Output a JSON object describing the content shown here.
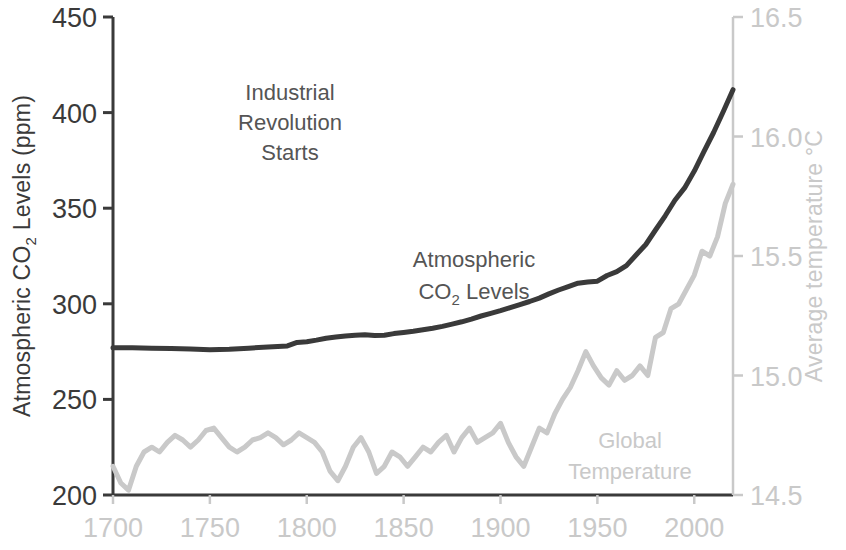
{
  "chart_data": {
    "type": "line",
    "title": "",
    "xlabel": "",
    "xlim": [
      1700,
      2020
    ],
    "x_ticks": [
      1700,
      1750,
      1800,
      1850,
      1900,
      1950,
      2000
    ],
    "x_tick_labels": [
      "1700",
      "1750",
      "1800",
      "1850",
      "1900",
      "1950",
      "2000"
    ],
    "grid": false,
    "legend_position": "inline-annotations",
    "axes": {
      "left": {
        "label": "Atmospheric CO₂ Levels (ppm)",
        "label_parts": [
          "Atmospheric CO",
          "2",
          " Levels (ppm)"
        ],
        "ylim": [
          200,
          450
        ],
        "ticks": [
          200,
          250,
          300,
          350,
          400,
          450
        ],
        "tick_labels": [
          "200",
          "250",
          "300",
          "350",
          "400",
          "450"
        ],
        "color": "#3a3a3a"
      },
      "right": {
        "label": "Average temperature °C",
        "ylim": [
          14.5,
          16.5
        ],
        "ticks": [
          14.5,
          15.0,
          15.5,
          16.0,
          16.5
        ],
        "tick_labels": [
          "14.5",
          "15.0",
          "15.5",
          "16.0",
          "16.5"
        ],
        "color": "#c9c9c9"
      }
    },
    "annotations": [
      {
        "name": "industrial-revolution",
        "text_lines": [
          "Industrial",
          "Revolution",
          "Starts"
        ],
        "x": 1760,
        "color": "#555555"
      },
      {
        "name": "co2-series-label",
        "text_lines": [
          "Atmospheric",
          "CO₂ Levels"
        ],
        "text_parts": [
          "Atmospheric",
          "CO",
          "2",
          " Levels"
        ],
        "x": 1855,
        "color": "#555555"
      },
      {
        "name": "temperature-series-label",
        "text_lines": [
          "Global",
          "Temperature"
        ],
        "x": 1985,
        "color": "#c9c9c9"
      }
    ],
    "series": [
      {
        "name": "Atmospheric CO2 Levels",
        "axis": "left",
        "unit": "ppm",
        "color": "#3a3a3a",
        "line_width": 5,
        "x": [
          1700,
          1710,
          1720,
          1730,
          1740,
          1750,
          1760,
          1770,
          1780,
          1790,
          1795,
          1800,
          1805,
          1810,
          1815,
          1820,
          1825,
          1830,
          1835,
          1840,
          1845,
          1850,
          1855,
          1860,
          1865,
          1870,
          1875,
          1880,
          1885,
          1890,
          1895,
          1900,
          1905,
          1910,
          1915,
          1920,
          1925,
          1930,
          1935,
          1940,
          1945,
          1950,
          1955,
          1960,
          1965,
          1970,
          1975,
          1980,
          1985,
          1990,
          1995,
          2000,
          2005,
          2010,
          2015,
          2020
        ],
        "y": [
          277.0,
          277.0,
          276.8,
          276.6,
          276.4,
          276.0,
          276.2,
          276.8,
          277.4,
          278.0,
          279.8,
          280.2,
          281.0,
          282.0,
          282.6,
          283.2,
          283.6,
          283.8,
          283.4,
          283.6,
          284.4,
          285.0,
          285.6,
          286.4,
          287.2,
          288.2,
          289.4,
          290.6,
          292.0,
          293.6,
          295.0,
          296.4,
          298.0,
          299.6,
          301.2,
          303.0,
          305.2,
          307.2,
          309.0,
          310.8,
          311.4,
          311.8,
          314.8,
          316.8,
          320.0,
          325.5,
          331.0,
          338.6,
          346.0,
          354.2,
          360.6,
          369.4,
          379.6,
          389.6,
          400.6,
          412.0
        ]
      },
      {
        "name": "Global Temperature",
        "axis": "right",
        "unit": "°C",
        "color": "#c9c9c9",
        "line_width": 5,
        "x": [
          1700,
          1704,
          1708,
          1712,
          1716,
          1720,
          1724,
          1728,
          1732,
          1736,
          1740,
          1744,
          1748,
          1752,
          1756,
          1760,
          1764,
          1768,
          1772,
          1776,
          1780,
          1784,
          1788,
          1792,
          1796,
          1800,
          1804,
          1808,
          1812,
          1816,
          1820,
          1824,
          1828,
          1832,
          1836,
          1840,
          1844,
          1848,
          1852,
          1856,
          1860,
          1864,
          1868,
          1872,
          1876,
          1880,
          1884,
          1888,
          1892,
          1896,
          1900,
          1904,
          1908,
          1912,
          1916,
          1920,
          1924,
          1928,
          1932,
          1936,
          1940,
          1944,
          1948,
          1952,
          1956,
          1960,
          1964,
          1968,
          1972,
          1976,
          1980,
          1984,
          1988,
          1992,
          1996,
          2000,
          2004,
          2008,
          2012,
          2016,
          2020
        ],
        "y": [
          14.62,
          14.55,
          14.52,
          14.62,
          14.68,
          14.7,
          14.68,
          14.72,
          14.75,
          14.73,
          14.7,
          14.73,
          14.77,
          14.78,
          14.74,
          14.7,
          14.68,
          14.7,
          14.73,
          14.74,
          14.76,
          14.74,
          14.71,
          14.73,
          14.76,
          14.74,
          14.72,
          14.68,
          14.6,
          14.56,
          14.62,
          14.7,
          14.74,
          14.68,
          14.59,
          14.62,
          14.68,
          14.66,
          14.62,
          14.66,
          14.7,
          14.68,
          14.72,
          14.75,
          14.68,
          14.74,
          14.78,
          14.72,
          14.74,
          14.76,
          14.8,
          14.72,
          14.66,
          14.62,
          14.7,
          14.78,
          14.76,
          14.84,
          14.9,
          14.95,
          15.02,
          15.1,
          15.04,
          14.99,
          14.96,
          15.02,
          14.98,
          15.0,
          15.04,
          15.0,
          15.16,
          15.18,
          15.28,
          15.3,
          15.36,
          15.42,
          15.52,
          15.5,
          15.58,
          15.72,
          15.8
        ]
      }
    ]
  }
}
